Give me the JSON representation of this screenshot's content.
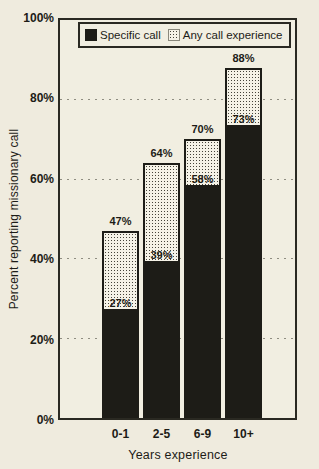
{
  "chart": {
    "ylabel": "Percent reporting missionary call",
    "xlabel": "Years experience",
    "legend": [
      "Specific call",
      "Any call experience"
    ]
  },
  "chart_data": {
    "type": "bar",
    "stacked": true,
    "title": "",
    "xlabel": "Years experience",
    "ylabel": "Percent reporting missionary call",
    "categories": [
      "0-1",
      "2-5",
      "6-9",
      "10+"
    ],
    "series": [
      {
        "name": "Specific call",
        "values": [
          27,
          39,
          58,
          73
        ]
      },
      {
        "name": "Any call experience",
        "values": [
          47,
          64,
          70,
          88
        ],
        "note": "total bar height; dotted segment = total minus specific"
      }
    ],
    "bar_value_labels": {
      "total": [
        "47%",
        "64%",
        "70%",
        "88%"
      ],
      "specific": [
        "27%",
        "39%",
        "58%",
        "73%"
      ]
    },
    "ylim": [
      0,
      100
    ],
    "yticks": [
      0,
      20,
      40,
      60,
      80,
      100
    ],
    "ytick_labels": [
      "0%",
      "20%",
      "40%",
      "60%",
      "80%",
      "100%"
    ],
    "gridlines": [
      20,
      40,
      60,
      80
    ],
    "grid_style": "dashed",
    "legend_position": "top-inside"
  },
  "colors": {
    "paper": "#efebde",
    "ink": "#1d1c17",
    "plot_border": "#2a2922",
    "grid": "#8f8d81",
    "dotted_fill_bg": "#f5f2e7"
  }
}
